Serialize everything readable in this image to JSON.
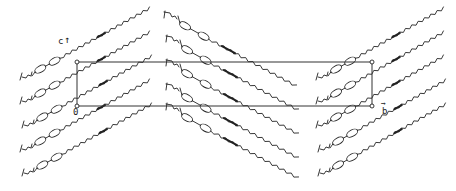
{
  "figure": {
    "axes": {
      "c_label": "c",
      "b_label": "b",
      "origin_label": "0"
    },
    "unit_cell": {
      "x0": 77,
      "y0": 62,
      "x1": 372,
      "y1": 106
    },
    "groups": [
      {
        "name": "left-layer",
        "direction": "up-right",
        "count": 5,
        "heads": [
          [
            20,
            80
          ],
          [
            20,
            104
          ],
          [
            22,
            128
          ],
          [
            20,
            152
          ],
          [
            22,
            176
          ]
        ],
        "dx": 130,
        "dy": -72
      },
      {
        "name": "middle-layer",
        "direction": "down-right",
        "count": 5,
        "heads": [
          [
            164,
            12
          ],
          [
            166,
            36
          ],
          [
            166,
            60
          ],
          [
            166,
            84
          ],
          [
            166,
            104
          ]
        ],
        "dx": 132,
        "dy": 74
      },
      {
        "name": "right-layer",
        "direction": "up-right",
        "count": 5,
        "heads": [
          [
            316,
            80
          ],
          [
            316,
            104
          ],
          [
            316,
            128
          ],
          [
            318,
            152
          ],
          [
            318,
            176
          ]
        ],
        "dx": 128,
        "dy": -72
      }
    ],
    "colors": {
      "ink": "#222222",
      "background": "#ffffff"
    }
  }
}
